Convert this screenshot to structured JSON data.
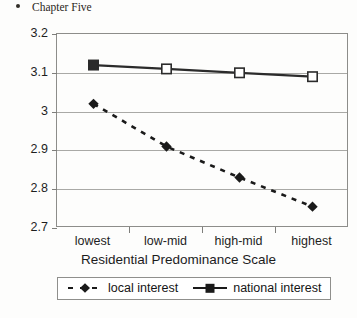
{
  "header": {
    "folio": ")",
    "bullet_icon": "bullet-dot-icon",
    "title": "Chapter Five"
  },
  "chart_data": {
    "type": "line",
    "title": "",
    "xlabel": "Residential Predominance Scale",
    "ylabel": "",
    "categories": [
      "lowest",
      "low-mid",
      "high-mid",
      "highest"
    ],
    "yticks": [
      "3.2",
      "3.1",
      "3",
      "2.9",
      "2.8",
      "2.7"
    ],
    "ytick_values": [
      3.2,
      3.1,
      3.0,
      2.9,
      2.8,
      2.7
    ],
    "ylim": [
      2.7,
      3.2
    ],
    "grid": true,
    "legend_position": "bottom",
    "series": [
      {
        "name": "local interest",
        "values": [
          3.02,
          2.91,
          2.83,
          2.755
        ],
        "line_style": "dashed",
        "marker": "filled-diamond",
        "color": "#1a1a1a"
      },
      {
        "name": "national interest",
        "values": [
          3.12,
          3.11,
          3.1,
          3.09
        ],
        "line_style": "solid",
        "marker": "square",
        "marker_fill_first": "filled-square",
        "color": "#2b2b2b"
      }
    ]
  },
  "legend": {
    "items": [
      {
        "label": "local interest",
        "key_icon": "dashed-diamond-key-icon"
      },
      {
        "label": "national interest",
        "key_icon": "solid-square-key-icon"
      }
    ]
  }
}
